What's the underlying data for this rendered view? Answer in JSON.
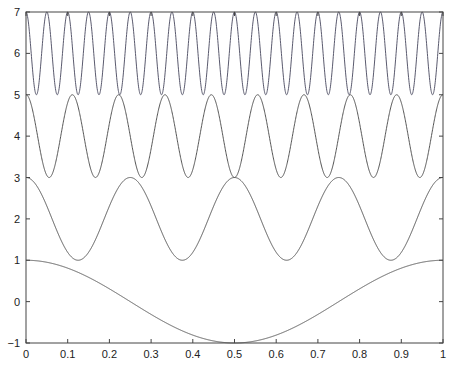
{
  "chart_data": {
    "type": "line",
    "title": "",
    "xlabel": "",
    "ylabel": "",
    "xlim": [
      0,
      1
    ],
    "ylim": [
      -1,
      7
    ],
    "grid": false,
    "legend": null,
    "x_ticks": [
      "0",
      "0.1",
      "0.2",
      "0.3",
      "0.4",
      "0.5",
      "0.6",
      "0.7",
      "0.8",
      "0.9",
      "1"
    ],
    "y_ticks": [
      "−1",
      "0",
      "1",
      "2",
      "3",
      "4",
      "5",
      "6",
      "7"
    ],
    "series": [
      {
        "name": "cos(2πx)",
        "offset": 0,
        "amplitude": 1,
        "cycles": 1,
        "color": "#555555"
      },
      {
        "name": "2+cos(8πx)",
        "offset": 2,
        "amplitude": 1,
        "cycles": 4,
        "color": "#555555"
      },
      {
        "name": "4+cos(18πx)",
        "offset": 4,
        "amplitude": 1,
        "cycles": 9,
        "color": "#555555"
      },
      {
        "name": "6+cos(40πx)",
        "offset": 6,
        "amplitude": 1,
        "cycles": 20,
        "color": "#5a5a6e"
      }
    ],
    "samples": {
      "x": [
        0,
        0.1,
        0.2,
        0.3,
        0.4,
        0.5,
        0.6,
        0.7,
        0.8,
        0.9,
        1
      ],
      "cos(2πx)": [
        1,
        0.81,
        0.31,
        -0.31,
        -0.81,
        -1,
        -0.81,
        -0.31,
        0.31,
        0.81,
        1
      ],
      "2+cos(8πx)": [
        3,
        1.69,
        2.31,
        2.31,
        1.69,
        3,
        1.69,
        2.31,
        2.31,
        1.69,
        3
      ],
      "4+cos(18πx)": [
        5,
        4.81,
        4.31,
        3.69,
        3.19,
        3,
        3.19,
        3.69,
        4.31,
        4.81,
        5
      ],
      "6+cos(40πx)": [
        7,
        7,
        7,
        7,
        7,
        7,
        7,
        7,
        7,
        7,
        7
      ]
    }
  },
  "layout": {
    "plot_left": 26,
    "plot_right": 443,
    "plot_top": 12,
    "plot_bottom": 343,
    "axis_color": "#444444"
  }
}
